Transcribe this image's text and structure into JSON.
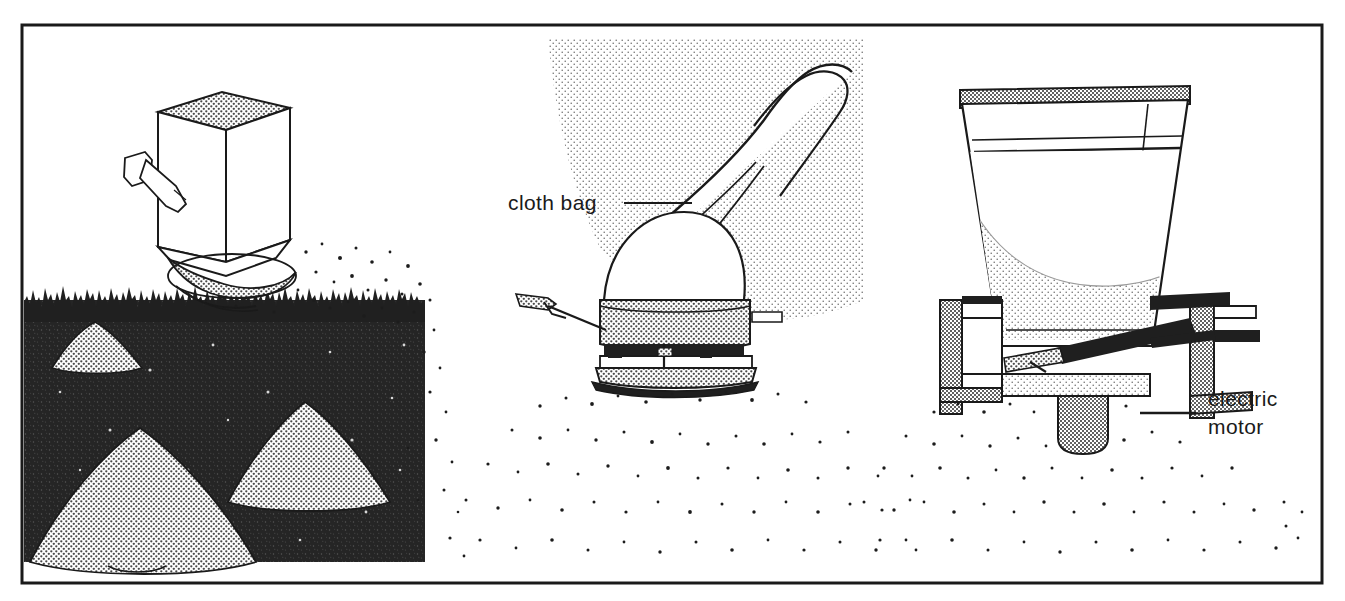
{
  "figure": {
    "border_color": "#1a1a1a",
    "background": "#ffffff",
    "ink_color": "#1a1a1a",
    "halftone_gray": "#9a9a9a",
    "soil_dark": "#2b2b2b"
  },
  "panels": [
    {
      "id": "panel-drop-spreader",
      "name": "drop-spreader-over-lawn",
      "description": "Box spreader with crank handle above grass, three cone piles of granular material on dark soil"
    },
    {
      "id": "panel-cloth-bag-spreader",
      "name": "cloth-bag-spreader",
      "description": "Hand-carried spreader with cloth bag hopper, broadcasting particles"
    },
    {
      "id": "panel-hopper-cutaway",
      "name": "hopper-cutaway-with-motor",
      "description": "Cutaway section of conical hopper filled with granules over housing with electric motor"
    }
  ],
  "labels": [
    {
      "id": "cloth-bag",
      "text": "cloth bag",
      "lines": [
        "cloth bag"
      ],
      "x": 508,
      "y": 210,
      "leader": {
        "x1": 624,
        "y1": 203,
        "x2": 692,
        "y2": 203
      }
    },
    {
      "id": "electric-motor",
      "text": "electric motor",
      "lines": [
        "electric",
        "motor"
      ],
      "x": 1208,
      "y": 406,
      "leader": {
        "x1": 1140,
        "y1": 413,
        "x2": 1196,
        "y2": 413
      }
    }
  ],
  "callout_labels": {
    "cloth_bag": "cloth bag",
    "electric_line1": "electric",
    "electric_line2": "motor"
  }
}
